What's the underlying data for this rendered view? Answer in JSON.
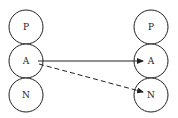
{
  "diagram": {
    "left_nodes": [
      {
        "label": "P"
      },
      {
        "label": "A"
      },
      {
        "label": "N"
      }
    ],
    "right_nodes": [
      {
        "label": "P"
      },
      {
        "label": "A"
      },
      {
        "label": "N"
      }
    ],
    "edges": [
      {
        "from": "A (left)",
        "to": "A (right)",
        "style": "solid"
      },
      {
        "from": "A (left)",
        "to": "N (right)",
        "style": "dashed"
      }
    ]
  }
}
